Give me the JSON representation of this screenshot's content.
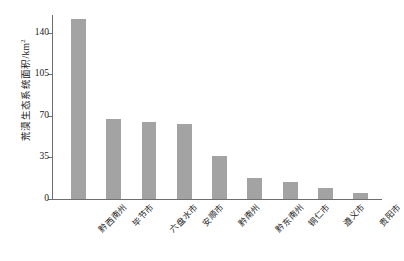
{
  "chart_data": {
    "type": "bar",
    "title": "",
    "subtitle": "",
    "xlabel": "",
    "ylabel": "荒漠生态系统面积/km",
    "ylabel_superscript": "2",
    "ylabel_full": "荒漠生态系统面积/km²",
    "categories": [
      "黔西南州",
      "毕节市",
      "六盘水市",
      "安顺市",
      "黔南州",
      "黔东南州",
      "铜仁市",
      "遵义市",
      "贵阳市"
    ],
    "values": [
      152,
      67,
      65,
      63,
      36,
      18,
      14,
      9,
      5
    ],
    "ylim": [
      0,
      155
    ],
    "yticks": [
      0,
      35,
      70,
      105,
      140
    ],
    "ytick_labels": [
      "0",
      "35",
      "70",
      "105",
      "140"
    ],
    "grid": false,
    "legend": false,
    "legend_position": "none",
    "bar_color": "#a3a3a3",
    "axis_color": "#6e6e6e",
    "background_color": "#ffffff"
  },
  "axis": {
    "tick_0": "0",
    "tick_1": "35",
    "tick_2": "70",
    "tick_3": "105",
    "tick_4": "140"
  },
  "x_axis_labels": {
    "l0": "黔西南州",
    "l1": "毕节市",
    "l2": "六盘水市",
    "l3": "安顺市",
    "l4": "黔南州",
    "l5": "黔东南州",
    "l6": "铜仁市",
    "l7": "遵义市",
    "l8": "贵阳市"
  }
}
